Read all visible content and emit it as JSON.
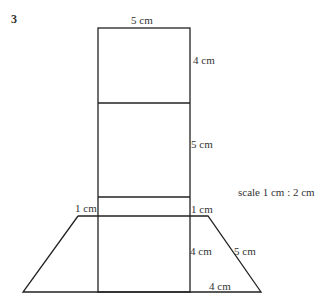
{
  "question_number": "3",
  "labels": {
    "top_width": "5 cm",
    "top_section_height": "4 cm",
    "middle_section_height": "5 cm",
    "strip_left": "1 cm",
    "strip_right": "1 cm",
    "trapezoid_height": "4 cm",
    "slant_side": "5 cm",
    "base_overhang": "4 cm",
    "scale": "scale 1 cm : 2 cm"
  },
  "colors": {
    "line": "#222222",
    "text": "#333333"
  }
}
